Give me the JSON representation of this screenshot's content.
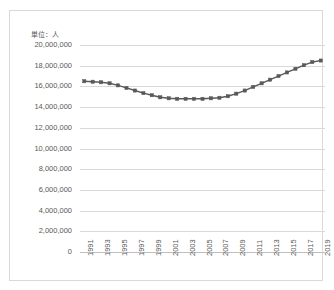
{
  "unit_label": "単位：人",
  "colors": {
    "line": "#595959",
    "grid": "#d9d9d9",
    "border": "#d9d9d9",
    "text": "#595959",
    "background": "#ffffff"
  },
  "chart_data": {
    "type": "line",
    "title": "",
    "subtitle": "",
    "xlabel": "",
    "ylabel": "単位：人",
    "grid": true,
    "legend": "none",
    "ylim": [
      0,
      20000000
    ],
    "ytick_labels": [
      "20,000,000",
      "18,000,000",
      "16,000,000",
      "14,000,000",
      "12,000,000",
      "10,000,000",
      "8,000,000",
      "6,000,000",
      "4,000,000",
      "2,000,000",
      "0"
    ],
    "ytick_values": [
      20000000,
      18000000,
      16000000,
      14000000,
      12000000,
      10000000,
      8000000,
      6000000,
      4000000,
      2000000,
      0
    ],
    "xtick_labels": [
      "1991",
      "1993",
      "1995",
      "1997",
      "1999",
      "2001",
      "2003",
      "2005",
      "2007",
      "2009",
      "2011",
      "2013",
      "2015",
      "2017",
      "2019"
    ],
    "x": [
      1991,
      1992,
      1993,
      1994,
      1995,
      1996,
      1997,
      1998,
      1999,
      2000,
      2001,
      2002,
      2003,
      2004,
      2005,
      2006,
      2007,
      2008,
      2009,
      2010,
      2011,
      2012,
      2013,
      2014,
      2015,
      2016,
      2017,
      2018,
      2019
    ],
    "values": [
      16500000,
      16450000,
      16400000,
      16300000,
      16100000,
      15850000,
      15600000,
      15350000,
      15150000,
      14950000,
      14850000,
      14800000,
      14800000,
      14800000,
      14800000,
      14850000,
      14900000,
      15050000,
      15300000,
      15600000,
      15950000,
      16300000,
      16650000,
      17000000,
      17350000,
      17700000,
      18050000,
      18350000,
      18500000
    ],
    "series": [
      {
        "name": "人口",
        "values": [
          16500000,
          16450000,
          16400000,
          16300000,
          16100000,
          15850000,
          15600000,
          15350000,
          15150000,
          14950000,
          14850000,
          14800000,
          14800000,
          14800000,
          14800000,
          14850000,
          14900000,
          15050000,
          15300000,
          15600000,
          15950000,
          16300000,
          16650000,
          17000000,
          17350000,
          17700000,
          18050000,
          18350000,
          18500000
        ]
      }
    ]
  }
}
